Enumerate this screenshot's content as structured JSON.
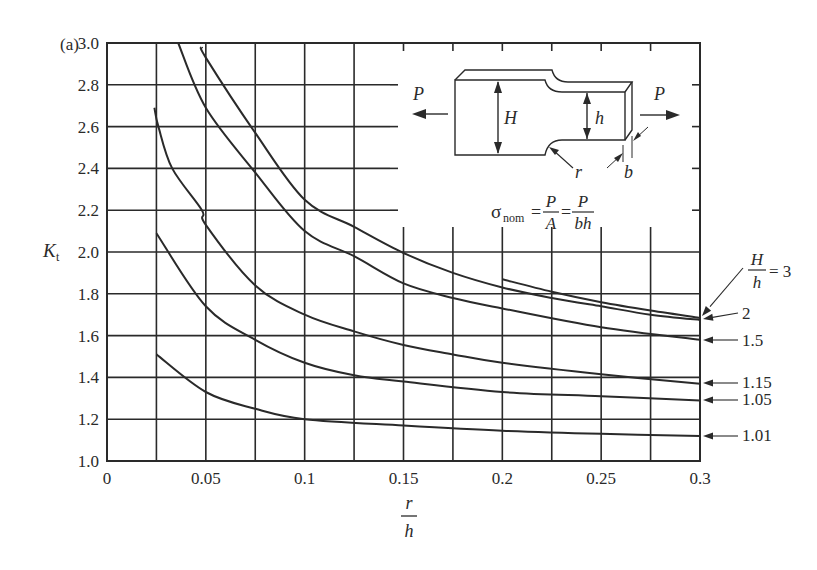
{
  "panel_label": "(a)",
  "colors": {
    "line": "#2a2a2a",
    "grid": "#2a2a2a",
    "background": "#ffffff"
  },
  "chart_data": {
    "type": "line",
    "title": "",
    "panel": "(a)",
    "xlabel": "r/h",
    "ylabel": "Kt",
    "xlim": [
      0,
      0.3
    ],
    "ylim": [
      1.0,
      3.0
    ],
    "grid": true,
    "x_ticks": [
      "0",
      "0.05",
      "0.1",
      "0.15",
      "0.2",
      "0.25",
      "0.3"
    ],
    "y_ticks": [
      "1.0",
      "1.2",
      "1.4",
      "1.6",
      "1.8",
      "2.0",
      "2.2",
      "2.4",
      "2.6",
      "2.8",
      "3.0"
    ],
    "x_grid_step": 0.025,
    "y_grid_step": 0.2,
    "legend_position": "right, arrows pointing to curve ends at r/h = 0.3",
    "legend_prefix": "H/h =",
    "series": [
      {
        "name": "3",
        "label": "H/h = 3",
        "x": [
          0.2,
          0.225,
          0.25,
          0.275,
          0.3
        ],
        "y": [
          1.87,
          1.81,
          1.76,
          1.72,
          1.685
        ]
      },
      {
        "name": "2",
        "label": "2",
        "x": [
          0.048,
          0.05,
          0.075,
          0.1,
          0.125,
          0.15,
          0.175,
          0.2,
          0.225,
          0.25,
          0.275,
          0.3
        ],
        "y": [
          2.98,
          2.93,
          2.57,
          2.25,
          2.12,
          1.995,
          1.9,
          1.83,
          1.78,
          1.74,
          1.7,
          1.675
        ]
      },
      {
        "name": "1.5",
        "label": "1.5",
        "x": [
          0.036,
          0.05,
          0.075,
          0.1,
          0.125,
          0.15,
          0.175,
          0.2,
          0.25,
          0.3
        ],
        "y": [
          3.0,
          2.69,
          2.38,
          2.1,
          1.98,
          1.85,
          1.78,
          1.73,
          1.64,
          1.58
        ]
      },
      {
        "name": "1.15",
        "label": "1.15",
        "x": [
          0.024,
          0.026,
          0.033,
          0.048,
          0.05,
          0.075,
          0.1,
          0.125,
          0.15,
          0.175,
          0.2,
          0.25,
          0.3
        ],
        "y": [
          2.69,
          2.6,
          2.4,
          2.2,
          2.13,
          1.84,
          1.7,
          1.62,
          1.555,
          1.51,
          1.47,
          1.415,
          1.37
        ]
      },
      {
        "name": "1.05",
        "label": "1.05",
        "x": [
          0.025,
          0.05,
          0.075,
          0.1,
          0.125,
          0.15,
          0.2,
          0.25,
          0.3
        ],
        "y": [
          2.09,
          1.74,
          1.58,
          1.47,
          1.41,
          1.38,
          1.33,
          1.31,
          1.29
        ]
      },
      {
        "name": "1.01",
        "label": "1.01",
        "x": [
          0.025,
          0.05,
          0.075,
          0.1,
          0.15,
          0.2,
          0.25,
          0.3
        ],
        "y": [
          1.51,
          1.33,
          1.25,
          1.2,
          1.17,
          1.145,
          1.13,
          1.12
        ]
      }
    ],
    "inset": {
      "description": "Stepped flat bar with shoulder fillets under axial tension",
      "load_label": "P",
      "large_width_label": "H",
      "small_width_label": "h",
      "radius_label": "r",
      "thickness_label": "b",
      "formula": "σnom = P/A = P/bh",
      "formula_parts": {
        "sigma": "σ",
        "sub": "nom",
        "eq": "=",
        "num1": "P",
        "den1": "A",
        "num2": "P",
        "den2": "bh"
      }
    }
  }
}
